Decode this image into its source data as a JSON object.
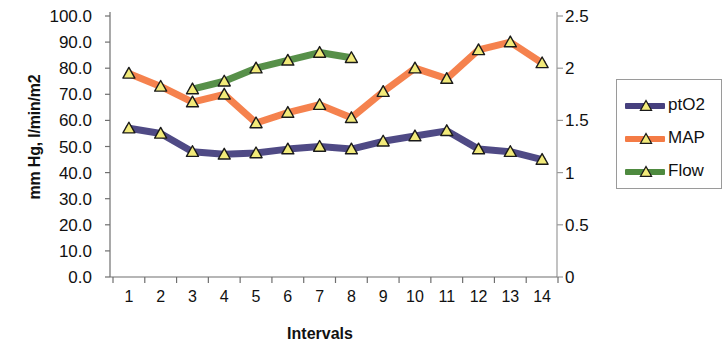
{
  "chart_data": {
    "type": "line",
    "title": "",
    "xlabel": "Intervals",
    "ylabel": "mm Hg, l/min/m2",
    "y2label": "",
    "categories": [
      1,
      2,
      3,
      4,
      5,
      6,
      7,
      8,
      9,
      10,
      11,
      12,
      13,
      14
    ],
    "x_tick_labels": [
      "1",
      "2",
      "3",
      "4",
      "5",
      "6",
      "7",
      "8",
      "9",
      "10",
      "11",
      "12",
      "13",
      "14"
    ],
    "ylim": [
      0,
      100
    ],
    "y_tick_labels": [
      "100.0",
      "90.0",
      "80.0",
      "70.0",
      "60.0",
      "50.0",
      "40.0",
      "30.0",
      "20.0",
      "10.0",
      "0.0"
    ],
    "y_ticks": [
      100,
      90,
      80,
      70,
      60,
      50,
      40,
      30,
      20,
      10,
      0
    ],
    "y2lim": [
      0,
      2.5
    ],
    "y2_tick_labels": [
      "2.5",
      "2",
      "1.5",
      "1",
      "0.5",
      "0"
    ],
    "y2_ticks": [
      2.5,
      2,
      1.5,
      1,
      0.5,
      0
    ],
    "grid": false,
    "legend_position": "right",
    "marker": "triangle",
    "series": [
      {
        "name": "ptO2",
        "axis": "left",
        "color": "#46407e",
        "x": [
          1,
          2,
          3,
          4,
          5,
          6,
          7,
          8,
          9,
          10,
          11,
          12,
          13,
          14
        ],
        "values": [
          57,
          55,
          48,
          47,
          47.5,
          49,
          50,
          49,
          52,
          54,
          56,
          49,
          48,
          45
        ]
      },
      {
        "name": "MAP",
        "axis": "left",
        "color": "#f47b45",
        "x": [
          1,
          2,
          3,
          4,
          5,
          6,
          7,
          8,
          9,
          10,
          11,
          12,
          13,
          14
        ],
        "values": [
          78,
          73,
          67,
          70,
          59,
          63,
          66,
          61,
          71,
          80,
          76,
          87,
          90,
          82
        ]
      },
      {
        "name": "Flow",
        "axis": "right",
        "color": "#4e8a3f",
        "x": [
          3,
          4,
          5,
          6,
          7,
          8
        ],
        "values": [
          1.8,
          1.88,
          2.0,
          2.08,
          2.16,
          2.11
        ],
        "values_left_scale": [
          72,
          75,
          80,
          83,
          86,
          84
        ]
      }
    ]
  },
  "legend": {
    "items": [
      {
        "label": "ptO2",
        "color": "#46407e"
      },
      {
        "label": "MAP",
        "color": "#f47b45"
      },
      {
        "label": "Flow",
        "color": "#4e8a3f"
      }
    ]
  },
  "marker_style": {
    "fill": "#f2ea7a",
    "stroke": "#1a1a1a"
  }
}
